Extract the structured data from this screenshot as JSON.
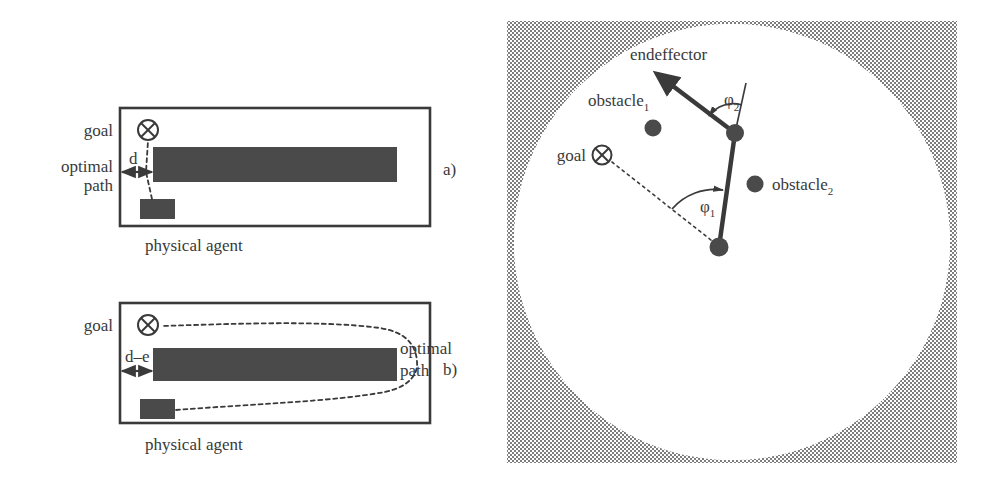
{
  "figure": {
    "type": "technical-diagram",
    "caption_absent": true,
    "panels": [
      {
        "id": "a",
        "label": "a)",
        "description": "Planar workspace with goal, obstacle wall and physical agent; optimal path is a straight dashed line of gap width d",
        "labels": {
          "goal": "goal",
          "optimal_path_line1": "optimal",
          "optimal_path_line2": "path",
          "gap": "d",
          "agent_caption": "physical agent"
        }
      },
      {
        "id": "b",
        "label": "b)",
        "description": "Same workspace with a narrowed gap d-e; the optimal path detours around the right end of the obstacle",
        "labels": {
          "goal": "goal",
          "optimal_path_line1": "optimal",
          "optimal_path_line2": "path",
          "gap": "d–e",
          "agent_caption": "physical agent"
        }
      },
      {
        "id": "c",
        "label": "",
        "description": "Circular reachable workspace of a two-link planar manipulator with two point obstacles, a goal and joint angles",
        "labels": {
          "endeffector": "endeffector",
          "obstacle1_base": "obstacle",
          "obstacle1_sub": "1",
          "obstacle2_base": "obstacle",
          "obstacle2_sub": "2",
          "goal": "goal",
          "phi1_base": "φ",
          "phi1_sub": "1",
          "phi2_base": "φ",
          "phi2_sub": "2"
        }
      }
    ]
  },
  "colors": {
    "ink": "#3a3a3a",
    "obstacle_fill": "#4a4a4a",
    "agent_fill": "#4a4a4a",
    "workspace_shade": "#8a8a8a",
    "workspace_free": "#ffffff",
    "frame_stroke": "#3a3a3a",
    "path_stroke": "#3a3a3a"
  },
  "geometry": {
    "panel_a_box": {
      "x": 120,
      "y": 108,
      "w": 310,
      "h": 118
    },
    "panel_a_obstacle": {
      "x": 153,
      "y": 147,
      "w": 244,
      "h": 35
    },
    "panel_a_agent": {
      "x": 140,
      "y": 199,
      "w": 35,
      "h": 20
    },
    "panel_a_goal": {
      "cx": 148,
      "cy": 130,
      "r": 10
    },
    "panel_a_gap_d": 33,
    "panel_b_box": {
      "x": 120,
      "y": 303,
      "w": 310,
      "h": 120
    },
    "panel_b_obstacle": {
      "x": 153,
      "y": 348,
      "w": 244,
      "h": 33
    },
    "panel_b_agent": {
      "x": 140,
      "y": 399,
      "w": 35,
      "h": 20
    },
    "panel_b_goal": {
      "cx": 148,
      "cy": 325,
      "r": 10
    },
    "panel_c_frame": {
      "x": 507,
      "y": 21,
      "w": 450,
      "h": 442
    },
    "panel_c_circle": {
      "cx": 732,
      "cy": 242,
      "r": 218
    },
    "panel_c_shoulder": {
      "x": 719,
      "y": 247
    },
    "panel_c_elbow": {
      "x": 735,
      "y": 133
    },
    "panel_c_endeffector_tip": {
      "x": 652,
      "y": 70
    },
    "panel_c_obstacle1": {
      "cx": 653,
      "cy": 128,
      "r": 8
    },
    "panel_c_obstacle2": {
      "cx": 755,
      "cy": 184,
      "r": 8
    },
    "panel_c_goal": {
      "cx": 602,
      "cy": 155,
      "r": 9
    }
  }
}
